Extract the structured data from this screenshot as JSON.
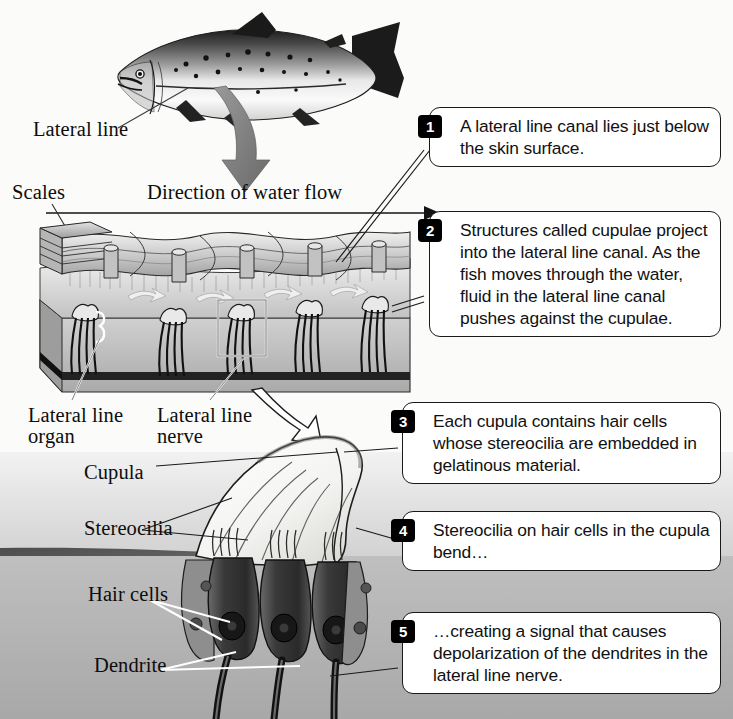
{
  "figure": {
    "background_color": "#fbfbfa"
  },
  "labels": {
    "lateral_line": "Lateral line",
    "scales": "Scales",
    "direction_of_water_flow": "Direction of water flow",
    "lateral_line_organ": "Lateral line\norgan",
    "lateral_line_nerve": "Lateral line\nnerve",
    "cupula": "Cupula",
    "stereocilia": "Stereocilia",
    "hair_cells": "Hair cells",
    "dendrite": "Dendrite"
  },
  "callouts": [
    {
      "number": "1",
      "text": "A lateral line canal lies just below the skin surface."
    },
    {
      "number": "2",
      "text": "Structures called cupulae project into the lateral line canal. As the fish moves through the water, fluid in the lateral line canal pushes against the cupulae."
    },
    {
      "number": "3",
      "text": "Each cupula contains hair cells whose stereocilia are embedded in gelatinous material."
    },
    {
      "number": "4",
      "text": "Stereocilia on hair cells in the cupula bend…"
    },
    {
      "number": "5",
      "text": "…creating a signal that causes depolarization of the dendrites in the lateral line nerve."
    }
  ],
  "colors": {
    "badge_fill": "#000000",
    "badge_text": "#ffffff",
    "callout_border": "#1a1a1a",
    "callout_fill": "#ffffff",
    "flow_arrow_fill": "#7c7c7c",
    "canal_fluid": "#dcdcdc",
    "epithelium_band": "#5a5a5a",
    "tissue": "#b5b5b5",
    "scale_gray": "#c6c6c6",
    "hair_cell_dark": "#3c3c3c",
    "cupula_white": "#f7f7f5"
  }
}
